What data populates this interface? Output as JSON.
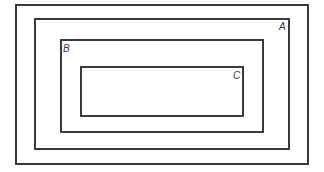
{
  "diagram": {
    "type": "nested-sets",
    "border_color": "#3a3a3a",
    "regions": [
      {
        "id": "universe",
        "label": ""
      },
      {
        "id": "A",
        "label": "A"
      },
      {
        "id": "B",
        "label": "B"
      },
      {
        "id": "C",
        "label": "C"
      }
    ]
  }
}
